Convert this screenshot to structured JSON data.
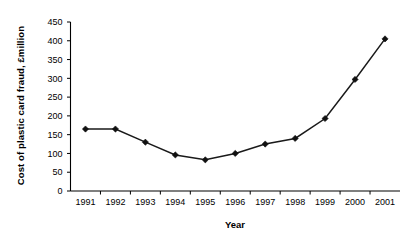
{
  "chart_data": {
    "type": "line",
    "title": "",
    "xlabel": "Year",
    "ylabel": "Cost of plastic card fraud, £million",
    "categories": [
      "1991",
      "1992",
      "1993",
      "1994",
      "1995",
      "1996",
      "1997",
      "1998",
      "1999",
      "2000",
      "2001"
    ],
    "values": [
      165,
      165,
      130,
      96,
      83,
      100,
      125,
      140,
      193,
      297,
      405
    ],
    "series": [
      {
        "name": "Cost of plastic card fraud",
        "values": [
          165,
          165,
          130,
          96,
          83,
          100,
          125,
          140,
          193,
          297,
          405
        ]
      }
    ],
    "ylim": [
      0,
      450
    ],
    "ytick_labels": [
      "0",
      "50",
      "100",
      "150",
      "200",
      "250",
      "300",
      "350",
      "400",
      "450"
    ],
    "ytick_values": [
      0,
      50,
      100,
      150,
      200,
      250,
      300,
      350,
      400,
      450
    ],
    "xtick_labels": [
      "1991",
      "1992",
      "1993",
      "1994",
      "1995",
      "1996",
      "1997",
      "1998",
      "1999",
      "2000",
      "2001"
    ],
    "grid": false,
    "legend": false,
    "legend_position": "none",
    "marker_style": "diamond",
    "line_color": "#1a1a1a",
    "marker_color": "#111111",
    "background_color": "#ffffff"
  },
  "axis_titles": {
    "y": "Cost of plastic card fraud, £million",
    "x": "Year"
  }
}
